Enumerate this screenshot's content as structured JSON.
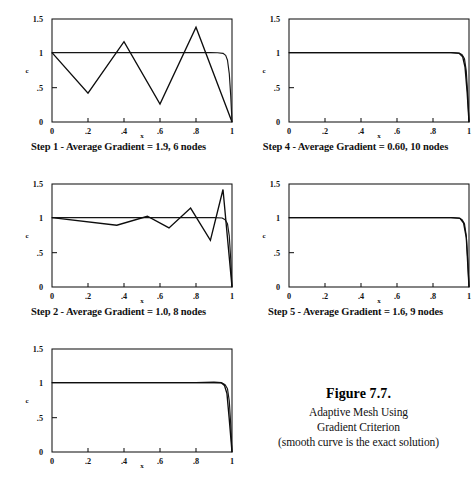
{
  "figure": {
    "title": "Figure 7.7.",
    "line1": "Adaptive Mesh Using",
    "line2": "Gradient Criterion",
    "line3": "(smooth curve is the exact solution)"
  },
  "axes": {
    "xlabel": "x",
    "ylabel": "c",
    "xticks": [
      "0",
      ".2",
      ".4",
      ".6",
      ".8",
      "1"
    ],
    "xtick_values": [
      0,
      0.2,
      0.4,
      0.6,
      0.8,
      1
    ],
    "yticks": [
      "1.5",
      "1",
      ".5",
      "0"
    ],
    "ytick_values": [
      1.5,
      1,
      0.5,
      0
    ],
    "xlim": [
      0,
      1
    ],
    "ylim": [
      0,
      1.5
    ]
  },
  "panels": [
    {
      "id": "step-1",
      "caption": "Step 1 - Average Gradient = 1.9, 6 nodes",
      "step": 1,
      "average_gradient": "1.9",
      "nodes": 6
    },
    {
      "id": "step-4",
      "caption": "Step 4 - Average Gradient = 0.60, 10 nodes",
      "step": 4,
      "average_gradient": "0.60",
      "nodes": 10
    },
    {
      "id": "step-2",
      "caption": "Step 2 - Average Gradient = 1.0, 8 nodes",
      "step": 2,
      "average_gradient": "1.0",
      "nodes": 8
    },
    {
      "id": "step-5",
      "caption": "Step 5 - Average Gradient = 1.6, 9 nodes",
      "step": 5,
      "average_gradient": "1.6",
      "nodes": 9
    },
    {
      "id": "step-3",
      "caption": "",
      "step": 3,
      "average_gradient": "",
      "nodes": 0
    }
  ],
  "chart_data": [
    {
      "type": "line",
      "title": "Step 1 - Average Gradient = 1.9, 6 nodes",
      "xlabel": "x",
      "ylabel": "c",
      "xlim": [
        0,
        1
      ],
      "ylim": [
        0,
        1.5
      ],
      "grid": false,
      "legend": "none",
      "series": [
        {
          "name": "exact solution",
          "x": [
            0,
            0.1,
            0.2,
            0.3,
            0.4,
            0.5,
            0.6,
            0.7,
            0.8,
            0.88,
            0.92,
            0.95,
            0.965,
            0.975,
            0.985,
            0.993,
            1
          ],
          "values": [
            1.01,
            1.01,
            1.01,
            1.01,
            1.01,
            1.01,
            1.01,
            1.01,
            1.01,
            1.01,
            1.008,
            1.0,
            0.97,
            0.9,
            0.7,
            0.38,
            0.0
          ]
        },
        {
          "name": "numerical (6 nodes)",
          "x": [
            0,
            0.2,
            0.4,
            0.6,
            0.8,
            1
          ],
          "values": [
            1.01,
            0.42,
            1.17,
            0.26,
            1.38,
            0.0
          ]
        }
      ]
    },
    {
      "type": "line",
      "title": "Step 4 - Average Gradient = 0.60, 10 nodes",
      "xlabel": "x",
      "ylabel": "c",
      "xlim": [
        0,
        1
      ],
      "ylim": [
        0,
        1.5
      ],
      "grid": false,
      "legend": "none",
      "series": [
        {
          "name": "exact solution",
          "x": [
            0,
            0.2,
            0.4,
            0.6,
            0.8,
            0.9,
            0.945,
            0.962,
            0.975,
            0.985,
            0.993,
            1
          ],
          "values": [
            1.01,
            1.01,
            1.01,
            1.01,
            1.01,
            1.01,
            1.005,
            0.98,
            0.92,
            0.74,
            0.4,
            0.0
          ]
        },
        {
          "name": "numerical (10 nodes)",
          "x": [
            0,
            0.2,
            0.4,
            0.6,
            0.8,
            0.9,
            0.945,
            0.965,
            0.978,
            0.99,
            1
          ],
          "values": [
            1.01,
            1.01,
            1.01,
            1.01,
            1.01,
            1.01,
            1.0,
            0.95,
            0.8,
            0.42,
            0.0
          ]
        }
      ]
    },
    {
      "type": "line",
      "title": "Step 2 - Average Gradient = 1.0, 8 nodes",
      "xlabel": "x",
      "ylabel": "c",
      "xlim": [
        0,
        1
      ],
      "ylim": [
        0,
        1.5
      ],
      "grid": false,
      "legend": "none",
      "series": [
        {
          "name": "exact solution",
          "x": [
            0,
            0.2,
            0.4,
            0.6,
            0.8,
            0.9,
            0.945,
            0.962,
            0.975,
            0.985,
            0.993,
            1
          ],
          "values": [
            1.01,
            1.01,
            1.01,
            1.01,
            1.01,
            1.01,
            1.005,
            0.98,
            0.92,
            0.74,
            0.4,
            0.0
          ]
        },
        {
          "name": "numerical (8 nodes)",
          "x": [
            0,
            0.36,
            0.53,
            0.65,
            0.77,
            0.88,
            0.95,
            1
          ],
          "values": [
            1.01,
            0.9,
            1.03,
            0.86,
            1.15,
            0.68,
            1.42,
            0.0
          ]
        }
      ]
    },
    {
      "type": "line",
      "title": "Step 5 - Average Gradient = 1.6, 9 nodes",
      "xlabel": "x",
      "ylabel": "c",
      "xlim": [
        0,
        1
      ],
      "ylim": [
        0,
        1.5
      ],
      "grid": false,
      "legend": "none",
      "series": [
        {
          "name": "exact solution",
          "x": [
            0,
            0.2,
            0.4,
            0.6,
            0.8,
            0.9,
            0.945,
            0.962,
            0.975,
            0.985,
            0.993,
            1
          ],
          "values": [
            1.01,
            1.01,
            1.01,
            1.01,
            1.01,
            1.01,
            1.005,
            0.98,
            0.92,
            0.74,
            0.4,
            0.0
          ]
        },
        {
          "name": "numerical (9 nodes)",
          "x": [
            0,
            0.2,
            0.4,
            0.6,
            0.8,
            0.9,
            0.95,
            0.97,
            0.985,
            1
          ],
          "values": [
            1.01,
            1.01,
            1.01,
            1.01,
            1.01,
            1.01,
            1.0,
            0.93,
            0.72,
            0.0
          ]
        }
      ]
    },
    {
      "type": "line",
      "title": "Step 3",
      "xlabel": "x",
      "ylabel": "c",
      "xlim": [
        0,
        1
      ],
      "ylim": [
        0,
        1.5
      ],
      "grid": false,
      "legend": "none",
      "series": [
        {
          "name": "exact solution",
          "x": [
            0,
            0.2,
            0.4,
            0.6,
            0.8,
            0.9,
            0.945,
            0.962,
            0.975,
            0.985,
            0.993,
            1
          ],
          "values": [
            1.01,
            1.01,
            1.01,
            1.01,
            1.01,
            1.01,
            1.005,
            0.98,
            0.92,
            0.74,
            0.4,
            0.0
          ]
        },
        {
          "name": "numerical",
          "x": [
            0,
            0.2,
            0.4,
            0.6,
            0.8,
            0.9,
            0.94,
            0.958,
            0.972,
            0.984,
            1
          ],
          "values": [
            1.01,
            1.01,
            1.01,
            1.01,
            1.01,
            1.015,
            1.01,
            0.97,
            0.85,
            0.5,
            0.0
          ]
        }
      ]
    }
  ]
}
